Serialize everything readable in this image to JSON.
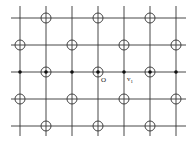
{
  "diagram": {
    "type": "lattice",
    "grid": {
      "x_lines": [
        20,
        46,
        72,
        98,
        124,
        150,
        176
      ],
      "y_lines": [
        18,
        45,
        72,
        99,
        126
      ],
      "x_extent": [
        11,
        186
      ],
      "y_extent": [
        6,
        136
      ],
      "line_color": "#333333"
    },
    "open_circles": [
      [
        46,
        18
      ],
      [
        98,
        18
      ],
      [
        150,
        18
      ],
      [
        20,
        45
      ],
      [
        72,
        45
      ],
      [
        124,
        45
      ],
      [
        176,
        45
      ],
      [
        46,
        72
      ],
      [
        98,
        72
      ],
      [
        150,
        72
      ],
      [
        20,
        99
      ],
      [
        72,
        99
      ],
      [
        124,
        99
      ],
      [
        176,
        99
      ],
      [
        46,
        126
      ],
      [
        98,
        126
      ],
      [
        150,
        126
      ]
    ],
    "filled_dots": [
      [
        20,
        72
      ],
      [
        46,
        72
      ],
      [
        72,
        72
      ],
      [
        98,
        72
      ],
      [
        124,
        72
      ],
      [
        150,
        72
      ],
      [
        176,
        72
      ]
    ],
    "labels": [
      {
        "id": "origin",
        "text": "O",
        "x": 101,
        "y": 82
      },
      {
        "id": "v1",
        "text": "v",
        "sub": "1",
        "x": 127,
        "y": 81
      }
    ]
  }
}
